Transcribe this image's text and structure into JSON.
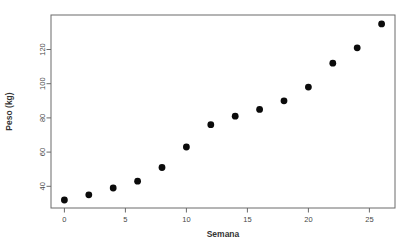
{
  "figure": {
    "background": "#ffffff",
    "border_color": "#6a6a6a",
    "tick_color": "#6a6a6a",
    "tick_label_color": "#474747",
    "axis_title_color": "#333333",
    "point_color": "#0b0b0b"
  },
  "chart_data": {
    "type": "scatter",
    "title": "",
    "xlabel": "Semana",
    "ylabel": "Peso (kg)",
    "x": [
      0,
      2,
      4,
      6,
      8,
      10,
      12,
      14,
      16,
      18,
      20,
      22,
      24,
      26
    ],
    "y": [
      32,
      35,
      39,
      43,
      51,
      63,
      76,
      81,
      85,
      90,
      98,
      112,
      121,
      135
    ],
    "series_name": "Peso",
    "xticks": [
      0,
      5,
      10,
      15,
      20,
      25
    ],
    "yticks": [
      40,
      60,
      80,
      100,
      120
    ],
    "xlim": [
      -1.1,
      27.1
    ],
    "ylim": [
      27.3,
      140.2
    ],
    "grid": false,
    "legend": null,
    "marker": "filled-circle",
    "marker_radius": 3.4
  }
}
